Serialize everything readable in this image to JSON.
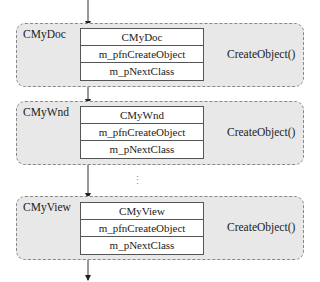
{
  "groups": [
    {
      "label": "CMyDoc",
      "rows": [
        "CMyDoc",
        "m_pfnCreateObject",
        "m_pNextClass"
      ],
      "target": "CreateObject()"
    },
    {
      "label": "CMyWnd",
      "rows": [
        "CMyWnd",
        "m_pfnCreateObject",
        "m_pNextClass"
      ],
      "target": "CreateObject()"
    },
    {
      "label": "CMyView",
      "rows": [
        "CMyView",
        "m_pfnCreateObject",
        "m_pNextClass"
      ],
      "target": "CreateObject()"
    }
  ],
  "ellipsis": "⋮",
  "colors": {
    "group_fill": "#e8e8e8",
    "group_border": "#888888",
    "line": "#333333"
  }
}
